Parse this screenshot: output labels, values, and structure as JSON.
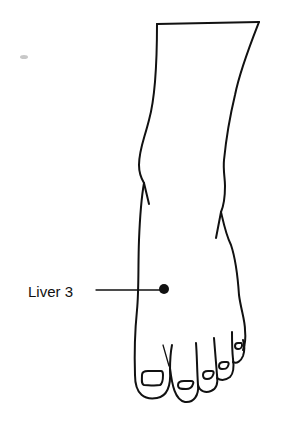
{
  "figure": {
    "annotation": {
      "label": "Liver 3",
      "marker_color": "#111111"
    },
    "colors": {
      "line": "#111111",
      "background": "#ffffff"
    }
  }
}
